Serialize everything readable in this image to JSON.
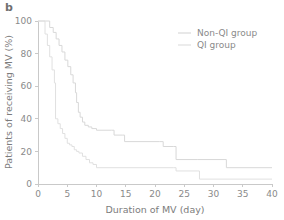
{
  "panel": {
    "label": "b"
  },
  "chart_data": {
    "type": "line",
    "title": "",
    "xlabel": "Duration of MV  (day)",
    "ylabel": "Patients of receiving MV  (%)",
    "xlim": [
      0,
      40
    ],
    "ylim": [
      0,
      100
    ],
    "xticks": [
      0,
      5,
      10,
      15,
      20,
      25,
      30,
      35,
      40
    ],
    "yticks": [
      0,
      20,
      40,
      60,
      80,
      100
    ],
    "xtick_labels": [
      "0",
      "5",
      "10",
      "15",
      "20",
      "25",
      "30",
      "35",
      "40"
    ],
    "ytick_labels": [
      "0",
      "20",
      "40",
      "60",
      "80",
      "100"
    ],
    "grid": false,
    "legend_position": "top-right",
    "step_type": "post",
    "series": [
      {
        "name": "Non-QI group",
        "color": "#d8d8d8",
        "x": [
          0,
          1.2,
          2.0,
          2.6,
          3.1,
          3.6,
          4.1,
          4.6,
          5.1,
          5.6,
          6.0,
          6.4,
          6.6,
          6.9,
          7.2,
          7.6,
          8.0,
          8.6,
          9.2,
          10.0,
          12.6,
          13.0,
          14.4,
          14.8,
          20.8,
          21.4,
          23.2,
          23.6,
          27.2,
          31.8,
          32.2,
          40.0
        ],
        "y": [
          100,
          100,
          96,
          93,
          89,
          85,
          81,
          76,
          72,
          67,
          62,
          56,
          50,
          44,
          41,
          38,
          36,
          35,
          34,
          33,
          33,
          30,
          30,
          26,
          26,
          23,
          23,
          15,
          15,
          15,
          10,
          10
        ]
      },
      {
        "name": "QI group",
        "color": "#e0e0e0",
        "x": [
          0,
          0.8,
          1.2,
          1.6,
          2.0,
          2.4,
          2.8,
          3.0,
          3.4,
          3.8,
          4.2,
          4.6,
          5.0,
          5.4,
          5.8,
          6.2,
          6.6,
          7.0,
          7.6,
          8.2,
          8.8,
          9.4,
          10.0,
          23.2,
          23.6,
          27.2,
          27.6,
          40.0
        ],
        "y": [
          100,
          100,
          92,
          85,
          78,
          70,
          62,
          40,
          37,
          34,
          31,
          28,
          25,
          24,
          23,
          21,
          20,
          19,
          17,
          15,
          13,
          12,
          10,
          10,
          8,
          8,
          3,
          3
        ]
      }
    ],
    "legend_entries": [
      {
        "label": "Non-QI group",
        "color": "#d8d8d8"
      },
      {
        "label": "QI group",
        "color": "#e0e0e0"
      }
    ]
  }
}
